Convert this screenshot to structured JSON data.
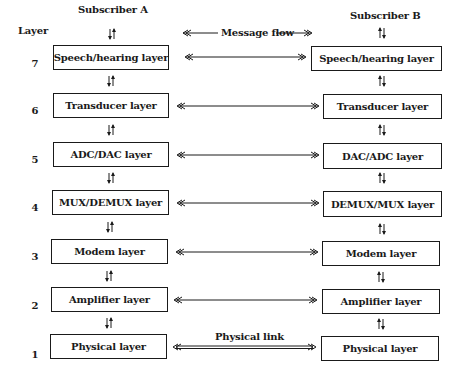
{
  "diagram": {
    "axis_label": "Layer",
    "subscriber_a": "Subscriber A",
    "subscriber_b": "Subscriber B",
    "message_flow": "Message flow",
    "physical_link": "Physical link",
    "layers": [
      {
        "number": "7",
        "a": "Speech/hearing layer",
        "b": "Speech/hearing layer"
      },
      {
        "number": "6",
        "a": "Transducer layer",
        "b": "Transducer layer"
      },
      {
        "number": "5",
        "a": "ADC/DAC layer",
        "b": "DAC/ADC layer"
      },
      {
        "number": "4",
        "a": "MUX/DEMUX layer",
        "b": "DEMUX/MUX layer"
      },
      {
        "number": "3",
        "a": "Modem layer",
        "b": "Modem layer"
      },
      {
        "number": "2",
        "a": "Amplifier layer",
        "b": "Amplifier layer"
      },
      {
        "number": "1",
        "a": "Physical layer",
        "b": "Physical layer"
      }
    ]
  }
}
